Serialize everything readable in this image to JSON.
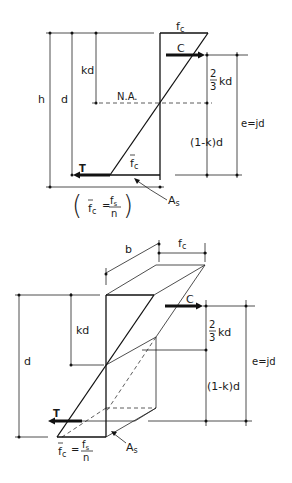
{
  "figure": {
    "top_diagram": {
      "labels": {
        "fc": "f",
        "fc_sub": "c",
        "C": "C",
        "T": "T",
        "h": "h",
        "d": "d",
        "kd": "kd",
        "na": "N.A.",
        "two": "2",
        "three": "3",
        "two_thirds_kd_suffix": "kd",
        "one_minus_k_d": "(1-k)d",
        "e_jd": "e=jd",
        "fc_bar": "f",
        "fc_bar_sub": "c",
        "As": "A",
        "As_sub": "s",
        "eq_lhs": "f",
        "eq_lhs_sub": "c",
        "eq_equals": "=",
        "eq_num": "f",
        "eq_num_sub": "s",
        "eq_den": "n",
        "paren_open": "(",
        "paren_close": ")"
      }
    },
    "bottom_diagram": {
      "labels": {
        "b": "b",
        "fc": "f",
        "fc_sub": "c",
        "C": "C",
        "T": "T",
        "d": "d",
        "kd": "kd",
        "two": "2",
        "three": "3",
        "two_thirds_kd_suffix": "kd",
        "one_minus_k_d": "(1-k)d",
        "e_jd": "e=jd",
        "As": "A",
        "As_sub": "s",
        "eq_lhs": "f",
        "eq_lhs_sub": "c",
        "eq_equals": "=",
        "eq_num": "f",
        "eq_num_sub": "s",
        "eq_den": "n"
      }
    }
  }
}
